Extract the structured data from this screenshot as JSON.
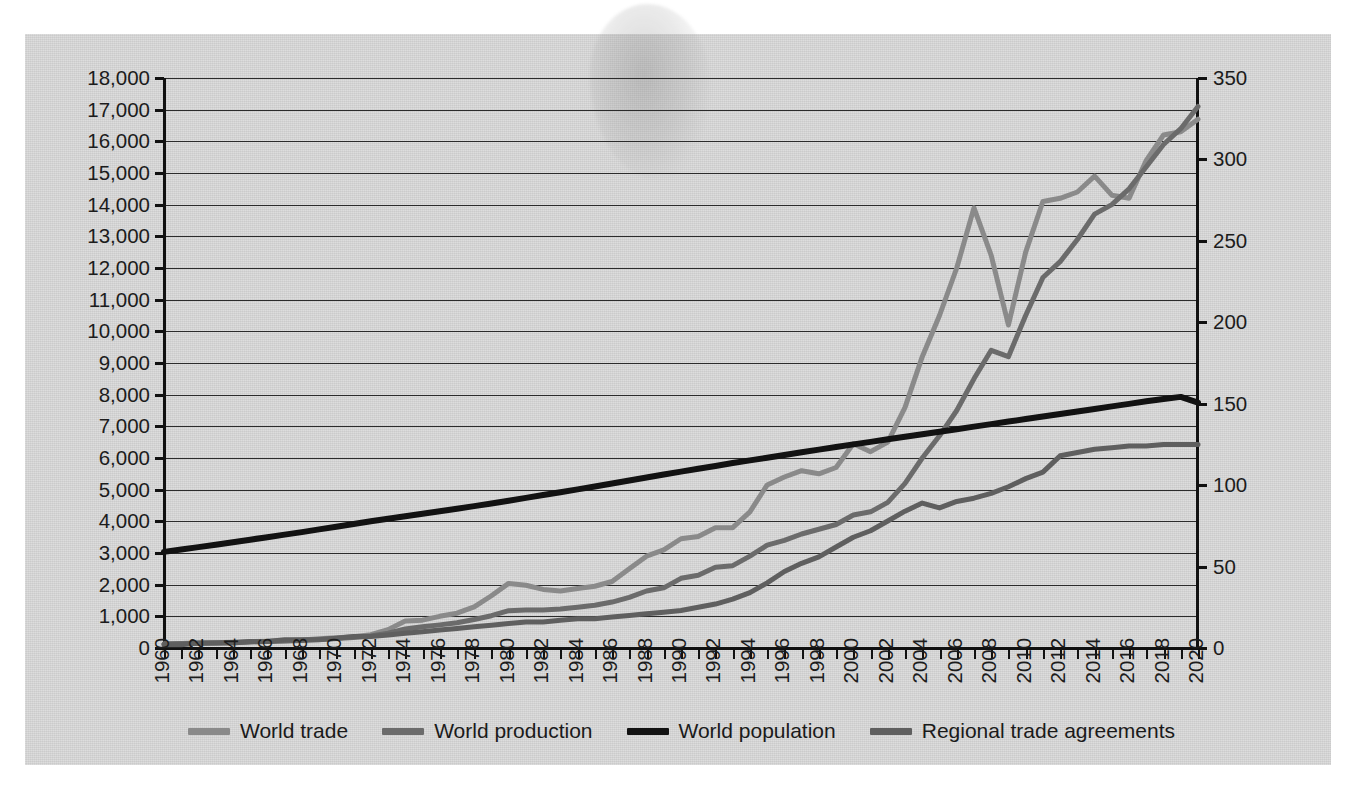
{
  "chart_data": {
    "type": "line",
    "title": "",
    "xlabel": "",
    "ylabel": "",
    "y2label": "",
    "grid": true,
    "legend_position": "bottom",
    "x": [
      1960,
      1961,
      1962,
      1963,
      1964,
      1965,
      1966,
      1967,
      1968,
      1969,
      1970,
      1971,
      1972,
      1973,
      1974,
      1975,
      1976,
      1977,
      1978,
      1979,
      1980,
      1981,
      1982,
      1983,
      1984,
      1985,
      1986,
      1987,
      1988,
      1989,
      1990,
      1991,
      1992,
      1993,
      1994,
      1995,
      1996,
      1997,
      1998,
      1999,
      2000,
      2001,
      2002,
      2003,
      2004,
      2005,
      2006,
      2007,
      2008,
      2009,
      2010,
      2011,
      2012,
      2013,
      2014,
      2015,
      2016,
      2017,
      2018,
      2019,
      2020
    ],
    "xticks": [
      1960,
      1962,
      1964,
      1966,
      1968,
      1970,
      1972,
      1974,
      1976,
      1978,
      1980,
      1982,
      1984,
      1986,
      1988,
      1990,
      1992,
      1994,
      1996,
      1998,
      2000,
      2002,
      2004,
      2006,
      2008,
      2010,
      2012,
      2014,
      2016,
      2018,
      2020
    ],
    "xtick_labels": [
      "1960",
      "1962",
      "1964",
      "1966",
      "1968",
      "1970",
      "1972",
      "1974",
      "1976",
      "1978",
      "1980",
      "1982",
      "1984",
      "1986",
      "1988",
      "1990",
      "1992",
      "1994",
      "1996",
      "1998",
      "2000",
      "2002",
      "2004",
      "2006",
      "2008",
      "2010",
      "2012",
      "2014",
      "2016",
      "2018",
      "2020"
    ],
    "ylim": [
      0,
      18000
    ],
    "yticks": [
      0,
      1000,
      2000,
      3000,
      4000,
      5000,
      6000,
      7000,
      8000,
      9000,
      10000,
      11000,
      12000,
      13000,
      14000,
      15000,
      16000,
      17000,
      18000
    ],
    "ytick_labels": [
      "0",
      "1,000",
      "2,000",
      "3,000",
      "4,000",
      "5,000",
      "6,000",
      "7,000",
      "8,000",
      "9,000",
      "10,000",
      "11,000",
      "12,000",
      "13,000",
      "14,000",
      "15,000",
      "16,000",
      "17,000",
      "18,000"
    ],
    "y2lim": [
      0,
      350
    ],
    "y2ticks": [
      0,
      50,
      100,
      150,
      200,
      250,
      300,
      350
    ],
    "y2tick_labels": [
      "0",
      "50",
      "100",
      "150",
      "200",
      "250",
      "300",
      "350"
    ],
    "series": [
      {
        "name": "World trade",
        "axis": "left",
        "color": "#8a8a8a",
        "width": 5,
        "values": [
          130,
          140,
          150,
          165,
          185,
          200,
          215,
          230,
          255,
          290,
          320,
          355,
          420,
          580,
          850,
          880,
          1000,
          1100,
          1300,
          1650,
          2040,
          1980,
          1850,
          1800,
          1880,
          1950,
          2100,
          2500,
          2900,
          3100,
          3450,
          3520,
          3800,
          3800,
          4300,
          5150,
          5400,
          5600,
          5500,
          5700,
          6450,
          6200,
          6500,
          7600,
          9200,
          10500,
          12000,
          13900,
          12400,
          10200,
          12500,
          14100,
          14200,
          14400,
          14900,
          14300,
          14200,
          15400,
          16200,
          16300,
          16700
        ]
      },
      {
        "name": "World production",
        "axis": "left",
        "color": "#6b6b6b",
        "width": 5,
        "values": [
          130,
          140,
          150,
          160,
          175,
          190,
          205,
          220,
          240,
          265,
          300,
          330,
          380,
          470,
          600,
          670,
          730,
          800,
          900,
          1020,
          1180,
          1200,
          1200,
          1230,
          1290,
          1350,
          1450,
          1600,
          1800,
          1900,
          2200,
          2300,
          2550,
          2600,
          2900,
          3250,
          3400,
          3600,
          3750,
          3900,
          4200,
          4300,
          4600,
          5200,
          6000,
          6700,
          7500,
          8500,
          9400,
          9200,
          10500,
          11700,
          12200,
          12900,
          13700,
          14000,
          14500,
          15200,
          15900,
          16400,
          17100
        ]
      },
      {
        "name": "World population",
        "axis": "left",
        "color": "#121212",
        "width": 6,
        "values": [
          3035,
          3110,
          3185,
          3260,
          3340,
          3420,
          3500,
          3580,
          3660,
          3745,
          3830,
          3915,
          4000,
          4080,
          4160,
          4240,
          4320,
          4400,
          4480,
          4565,
          4650,
          4740,
          4830,
          4920,
          5010,
          5100,
          5195,
          5290,
          5385,
          5480,
          5570,
          5660,
          5750,
          5840,
          5925,
          6010,
          6095,
          6180,
          6265,
          6350,
          6430,
          6510,
          6590,
          6670,
          6750,
          6830,
          6910,
          6990,
          7070,
          7150,
          7230,
          7310,
          7390,
          7470,
          7550,
          7630,
          7710,
          7790,
          7860,
          7930,
          7750
        ]
      },
      {
        "name": "Regional trade agreements",
        "axis": "right",
        "color": "#5f5f5f",
        "width": 5,
        "values": [
          2,
          2,
          3,
          3,
          3,
          4,
          4,
          5,
          5,
          5,
          6,
          7,
          7,
          8,
          9,
          10,
          11,
          12,
          13,
          14,
          15,
          16,
          16,
          17,
          18,
          18,
          19,
          20,
          21,
          22,
          23,
          25,
          27,
          30,
          34,
          40,
          47,
          52,
          56,
          62,
          68,
          72,
          78,
          84,
          89,
          86,
          90,
          92,
          95,
          99,
          104,
          108,
          118,
          120,
          122,
          123,
          124,
          124,
          125,
          125,
          125
        ]
      }
    ],
    "legend": [
      {
        "label": "World trade",
        "color": "#8a8a8a"
      },
      {
        "label": "World production",
        "color": "#6b6b6b"
      },
      {
        "label": "World population",
        "color": "#121212"
      },
      {
        "label": "Regional trade agreements",
        "color": "#5f5f5f"
      }
    ],
    "colors": {
      "background": "#d2d2d2",
      "grid": "#2b2b2b",
      "axis": "#111111",
      "text": "#1c1c1c"
    }
  }
}
